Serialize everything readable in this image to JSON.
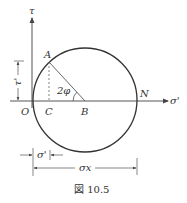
{
  "figure": {
    "caption": "図 10.5",
    "axes": {
      "vertical_label": "τ",
      "horizontal_label": "σ'"
    },
    "points": {
      "origin": "O",
      "A": "A",
      "C": "C",
      "B": "B",
      "N": "N"
    },
    "angle_label": "2φ",
    "dimensions": {
      "tau_prime": "τ'",
      "sigma_prime": "σ'",
      "sigma_x": "σx"
    }
  }
}
